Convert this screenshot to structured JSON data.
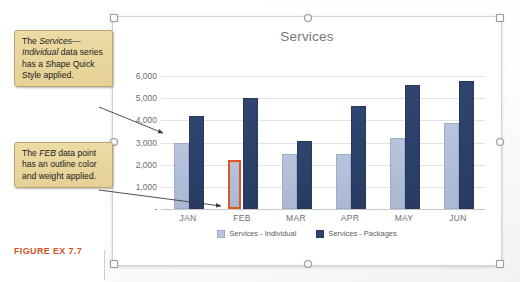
{
  "figure": {
    "caption": "FIGURE EX 7.7"
  },
  "chart": {
    "title": "Services",
    "selected": true
  },
  "annotations": [
    {
      "id": "callout-series-style",
      "text_parts": [
        {
          "text": "The ",
          "style": "normal"
        },
        {
          "text": "Services—Individual",
          "style": "italic"
        },
        {
          "text": " data series has a Shape Quick Style applied.",
          "style": "normal"
        }
      ],
      "plain_text": "The Services—Individual data series has a Shape Quick Style applied."
    },
    {
      "id": "callout-datapoint-outline",
      "text_parts": [
        {
          "text": "The ",
          "style": "normal"
        },
        {
          "text": "FEB",
          "style": "italic"
        },
        {
          "text": " data point has an outline color and weight applied.",
          "style": "normal"
        }
      ],
      "plain_text": "The FEB data point has an outline color and weight applied."
    }
  ],
  "colors": {
    "series_individual": "#b8c4dc",
    "series_packages": "#2f456f",
    "highlight_outline": "#e0541f",
    "caption": "#d2531f",
    "callout_fill": "#e8d79b",
    "gridline": "#e2e2e2",
    "axis_text": "#6e6e6e",
    "title_text": "#767676"
  },
  "chart_data": {
    "type": "bar",
    "title": "Services",
    "xlabel": "",
    "ylabel": "",
    "categories": [
      "JAN",
      "FEB",
      "MAR",
      "APR",
      "MAY",
      "JUN"
    ],
    "series": [
      {
        "name": "Services - Individual",
        "values": [
          2900,
          2200,
          2400,
          2400,
          3100,
          3800
        ],
        "color": "#b8c4dc"
      },
      {
        "name": "Services - Packages",
        "values": [
          4100,
          4900,
          3000,
          4550,
          5500,
          5700
        ],
        "color": "#2f456f"
      }
    ],
    "ylim": [
      0,
      6500
    ],
    "ytick_values": [
      0,
      1000,
      2000,
      3000,
      4000,
      5000,
      6000
    ],
    "ytick_labels": [
      "-",
      "1,000",
      "2,000",
      "3,000",
      "4,000",
      "5,000",
      "6,000"
    ],
    "grid": true,
    "legend_position": "bottom",
    "legend_entries": [
      "Services - Individual",
      "Services - Packages"
    ],
    "highlighted_point": {
      "series": "Services - Individual",
      "category": "FEB",
      "outline_color": "#e0541f",
      "outline_weight": "2.5pt"
    }
  }
}
